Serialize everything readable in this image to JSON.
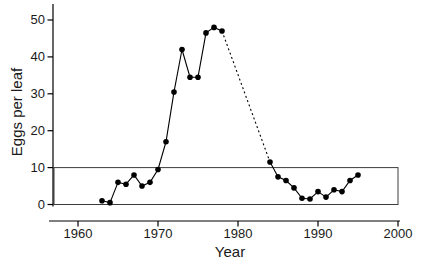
{
  "figure": {
    "background": "#ffffff",
    "ink_color": "#000000",
    "frame_color": "#3c3c3c"
  },
  "chart_data": {
    "type": "line",
    "title": "",
    "xlabel": "Year",
    "ylabel": "Eggs per leaf",
    "xlim": [
      1956,
      2001
    ],
    "ylim": [
      0,
      54
    ],
    "x_ticks": [
      1960,
      1970,
      1980,
      1990,
      2000
    ],
    "y_ticks": [
      0,
      10,
      20,
      30,
      40,
      50
    ],
    "grid": false,
    "legend_position": "none",
    "marker_style": "filled-black-circle",
    "line_color": "#000000",
    "series": [
      {
        "name": "eggs-per-leaf-observed-early",
        "style": "solid",
        "markers": true,
        "points": [
          [
            1963,
            1
          ],
          [
            1964,
            0.5
          ],
          [
            1965,
            6
          ],
          [
            1966,
            5.5
          ],
          [
            1967,
            8
          ],
          [
            1968,
            5
          ],
          [
            1969,
            6
          ],
          [
            1970,
            9.5
          ],
          [
            1971,
            17
          ],
          [
            1972,
            30.5
          ],
          [
            1973,
            42
          ],
          [
            1974,
            34.5
          ],
          [
            1975,
            34.5
          ],
          [
            1976,
            46.5
          ],
          [
            1977,
            48
          ],
          [
            1978,
            47
          ]
        ]
      },
      {
        "name": "eggs-per-leaf-gap-interpolated",
        "style": "dashed",
        "markers": false,
        "points": [
          [
            1978,
            47
          ],
          [
            1984,
            11.5
          ]
        ]
      },
      {
        "name": "eggs-per-leaf-observed-late",
        "style": "solid",
        "markers": true,
        "points": [
          [
            1984,
            11.5
          ],
          [
            1985,
            7.5
          ],
          [
            1986,
            6.5
          ],
          [
            1987,
            4.5
          ],
          [
            1988,
            1.7
          ],
          [
            1989,
            1.5
          ],
          [
            1990,
            3.5
          ],
          [
            1991,
            2
          ],
          [
            1992,
            4
          ],
          [
            1993,
            3.5
          ],
          [
            1994,
            6.5
          ],
          [
            1995,
            8
          ]
        ]
      }
    ],
    "annotations": [
      {
        "type": "rect",
        "label": "low-density-reference-box",
        "x0": 1957,
        "x1": 2000,
        "y0": 0,
        "y1": 10
      }
    ]
  }
}
